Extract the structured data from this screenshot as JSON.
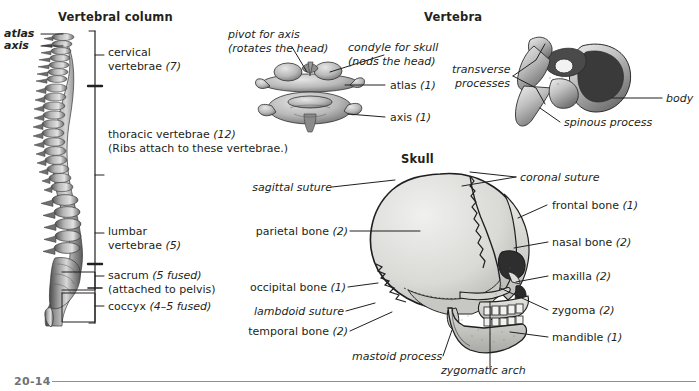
{
  "figure": {
    "footer_number": "20-14",
    "background_color": "#ffffff",
    "ink_color": "#231f20",
    "rule_color": "#8d9195"
  },
  "panels": {
    "vertebral_column": {
      "title": "Vertebral column",
      "callouts": [
        {
          "name": "atlas",
          "text": "atlas",
          "qty": ""
        },
        {
          "name": "axis",
          "text": "axis",
          "qty": ""
        }
      ],
      "regions": [
        {
          "name": "cervical",
          "line1": "cervical",
          "line2": "vertebrae",
          "qty": "(7)",
          "note": ""
        },
        {
          "name": "thoracic",
          "line1": "thoracic vertebrae",
          "line2": "",
          "qty": "(12)",
          "note": "(Ribs attach to these vertebrae.)"
        },
        {
          "name": "lumbar",
          "line1": "lumbar",
          "line2": "vertebrae",
          "qty": "(5)",
          "note": ""
        },
        {
          "name": "sacrum",
          "line1": "sacrum",
          "line2": "",
          "qty": "(5 fused)",
          "note": "(attached to pelvis)"
        },
        {
          "name": "coccyx",
          "line1": "coccyx",
          "line2": "",
          "qty": "(4–5 fused)",
          "note": ""
        }
      ]
    },
    "vertebra": {
      "title": "Vertebra",
      "atlas_axis_labels": [
        {
          "name": "pivot-for-axis",
          "line1": "pivot for axis",
          "line2": "(rotates the head)"
        },
        {
          "name": "condyle-for-skull",
          "line1": "condyle for skull",
          "line2": "(nods the head)"
        },
        {
          "name": "atlas",
          "text": "atlas",
          "qty": "(1)"
        },
        {
          "name": "axis",
          "text": "axis",
          "qty": "(1)"
        }
      ],
      "lumbar_vertebra_labels": [
        {
          "name": "transverse-processes",
          "line1": "transverse",
          "line2": "processes"
        },
        {
          "name": "body",
          "text": "body"
        },
        {
          "name": "spinous-process",
          "text": "spinous process"
        }
      ]
    },
    "skull": {
      "title": "Skull",
      "left_labels": [
        {
          "name": "sagittal-suture",
          "text": "sagittal suture",
          "qty": "",
          "style": "italic"
        },
        {
          "name": "parietal-bone",
          "text": "parietal bone",
          "qty": "(2)",
          "style": "bold-italic"
        },
        {
          "name": "occipital-bone",
          "text": "occipital bone",
          "qty": "(1)",
          "style": "bold-italic"
        },
        {
          "name": "lambdoid-suture",
          "text": "lambdoid suture",
          "qty": "",
          "style": "italic"
        },
        {
          "name": "temporal-bone",
          "text": "temporal bone",
          "qty": "(2)",
          "style": "bold-italic"
        },
        {
          "name": "mastoid-process",
          "text": "mastoid process",
          "qty": "",
          "style": "italic"
        },
        {
          "name": "zygomatic-arch",
          "text": "zygomatic arch",
          "qty": "",
          "style": "italic"
        }
      ],
      "right_labels": [
        {
          "name": "coronal-suture",
          "text": "coronal suture",
          "qty": "",
          "style": "italic"
        },
        {
          "name": "frontal-bone",
          "text": "frontal bone",
          "qty": "(1)",
          "style": "bold-italic"
        },
        {
          "name": "nasal-bone",
          "text": "nasal bone",
          "qty": "(2)",
          "style": "bold-italic"
        },
        {
          "name": "maxilla",
          "text": "maxilla",
          "qty": "(2)",
          "style": "bold-italic"
        },
        {
          "name": "zygoma",
          "text": "zygoma",
          "qty": "(2)",
          "style": "bold-italic"
        },
        {
          "name": "mandible",
          "text": "mandible",
          "qty": "(1)",
          "style": "bold-italic"
        }
      ]
    }
  }
}
